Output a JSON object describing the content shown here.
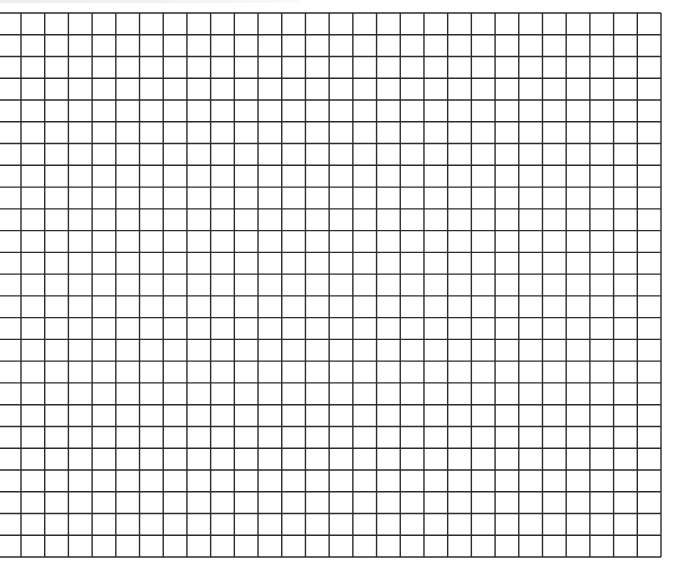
{
  "page": {
    "width": 681,
    "height": 571,
    "background": "#ffffff"
  },
  "grid": {
    "line_color": "#2b2b2b",
    "line_width": 1.4,
    "left_edge_x": 0,
    "first_vertical_x": 21,
    "right_edge_x": 661,
    "top_edge_y": 13,
    "bottom_edge_y": 557,
    "vertical_line_count": 28,
    "horizontal_line_count": 26,
    "column_count": 28,
    "row_count": 25,
    "has_left_border": false
  },
  "header_text": {
    "visible": true,
    "legible": false
  }
}
